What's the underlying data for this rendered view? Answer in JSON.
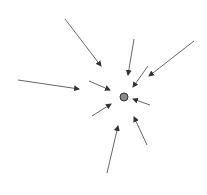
{
  "diagram": {
    "title": "",
    "width": 207,
    "height": 195,
    "background": "#ffffff",
    "center": {
      "x": 124,
      "y": 97,
      "r": 4,
      "fill": "#8a8a8a",
      "stroke": "#333333"
    },
    "arrow_color": "#555555",
    "arrows": [
      {
        "x1": 65,
        "y1": 19,
        "x2": 101,
        "y2": 66
      },
      {
        "x1": 134,
        "y1": 39,
        "x2": 128,
        "y2": 75
      },
      {
        "x1": 148,
        "y1": 66,
        "x2": 133,
        "y2": 87
      },
      {
        "x1": 194,
        "y1": 41,
        "x2": 149,
        "y2": 76
      },
      {
        "x1": 18,
        "y1": 80,
        "x2": 79,
        "y2": 89
      },
      {
        "x1": 89,
        "y1": 81,
        "x2": 110,
        "y2": 90
      },
      {
        "x1": 92,
        "y1": 116,
        "x2": 111,
        "y2": 104
      },
      {
        "x1": 150,
        "y1": 105,
        "x2": 133,
        "y2": 99
      },
      {
        "x1": 147,
        "y1": 145,
        "x2": 134,
        "y2": 117
      },
      {
        "x1": 107,
        "y1": 173,
        "x2": 118,
        "y2": 126
      }
    ]
  }
}
